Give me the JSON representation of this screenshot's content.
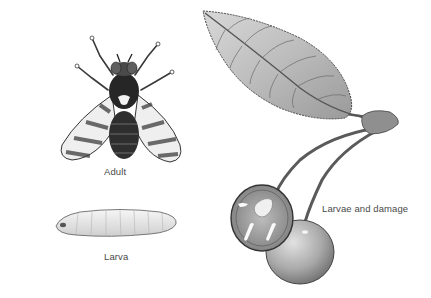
{
  "figure": {
    "labels": {
      "adult": "Adult",
      "larva": "Larva",
      "damage": "Larvae and damage"
    },
    "illustrations": [
      {
        "id": "adult-fly",
        "description": "Adult fly, dorsal view, banded wings"
      },
      {
        "id": "larva",
        "description": "Pale segmented maggot"
      },
      {
        "id": "cherry-leaf",
        "description": "Serrated cherry leaf with veins"
      },
      {
        "id": "cherries",
        "description": "Two cherries on stems, one cut open showing larvae"
      }
    ],
    "colors": {
      "background": "#ffffff",
      "ink": "#2a2a2a",
      "label_text": "#4a4a4a",
      "leaf_fill": "#c9c9c9",
      "cherry_fill": "#a8a8a8"
    }
  }
}
